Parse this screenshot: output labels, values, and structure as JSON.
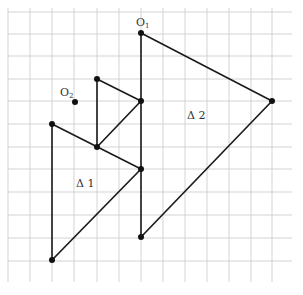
{
  "diagram": {
    "title": "",
    "grid": {
      "x_lines": [
        8,
        30,
        52,
        74,
        97,
        119,
        141,
        163,
        185,
        207,
        229,
        251,
        272
      ],
      "y_lines": [
        12,
        34,
        56,
        79,
        101,
        124,
        147,
        169,
        192,
        215,
        238,
        261
      ],
      "x_extent": [
        8,
        292
      ],
      "y_extent": [
        8,
        282
      ],
      "color": "#c8c8c8"
    },
    "labels": {
      "o1": {
        "main": "O",
        "sub": "1",
        "x": 136,
        "y": 26
      },
      "o2": {
        "main": "O",
        "sub": "2",
        "x": 60,
        "y": 96
      },
      "delta1": {
        "text": "Δ 1",
        "x": 76,
        "y": 187
      },
      "delta2": {
        "text": "Δ 2",
        "x": 187,
        "y": 119
      }
    },
    "points": {
      "O1": [
        141,
        33
      ],
      "O2": [
        75,
        102
      ],
      "T2_right": [
        272,
        101
      ],
      "T2_bottom": [
        141,
        237
      ],
      "T1_top": [
        52,
        124
      ],
      "T1_right": [
        141,
        169
      ],
      "T1_bottom": [
        52,
        260
      ],
      "S_top": [
        97,
        79
      ],
      "S_right": [
        141,
        101
      ],
      "S_bottom": [
        97,
        147
      ]
    },
    "shapes": [
      {
        "name": "triangle-2",
        "label": "Δ 2",
        "vertices": [
          [
            141,
            33
          ],
          [
            272,
            101
          ],
          [
            141,
            237
          ]
        ]
      },
      {
        "name": "triangle-1",
        "label": "Δ 1",
        "vertices": [
          [
            52,
            124
          ],
          [
            141,
            169
          ],
          [
            52,
            260
          ]
        ]
      },
      {
        "name": "small-triangle",
        "label": "",
        "vertices": [
          [
            97,
            79
          ],
          [
            141,
            101
          ],
          [
            97,
            147
          ]
        ]
      }
    ],
    "colors": {
      "edge": "#1a1a1a",
      "vertex": "#111111",
      "grid": "#c8c8c8"
    }
  }
}
